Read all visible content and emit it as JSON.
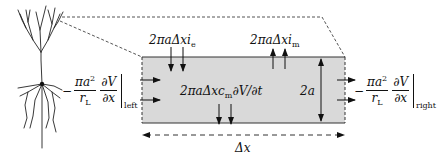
{
  "diagram": {
    "neuron_icon": "pyramidal-neuron",
    "compartment": {
      "fill": "#d9d9d9",
      "stroke": "#333333"
    },
    "labels": {
      "electrode_current": {
        "prefix": "2πaΔxi",
        "subscript": "e"
      },
      "membrane_current": {
        "prefix": "2πaΔxi",
        "subscript": "m"
      },
      "capacitive_current": {
        "prefix": "2πaΔxc",
        "subscript": "m",
        "suffix": "∂V/∂t"
      },
      "diameter": "2a",
      "length": "Δx",
      "left_flux": {
        "sign": "−",
        "num1": "πa",
        "num1_sup": "2",
        "den1": "r",
        "den1_sub": "L",
        "num2": "∂V",
        "den2": "∂x",
        "side": "left"
      },
      "right_flux": {
        "sign": "−",
        "num1": "πa",
        "num1_sup": "2",
        "den1": "r",
        "den1_sub": "L",
        "num2": "∂V",
        "den2": "∂x",
        "side": "right"
      }
    }
  }
}
